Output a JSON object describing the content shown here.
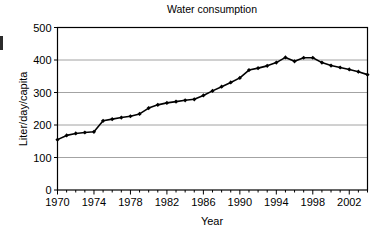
{
  "chart_data": {
    "type": "line",
    "title": "Water consumption",
    "xlabel": "Year",
    "ylabel": "Liter/day/capita",
    "xlim": [
      1970,
      2004
    ],
    "ylim": [
      0,
      500
    ],
    "yticks": [
      0,
      100,
      200,
      300,
      400,
      500
    ],
    "xticks": [
      1970,
      1974,
      1978,
      1982,
      1986,
      1990,
      1994,
      1998,
      2002
    ],
    "xtick_labels": [
      "1970",
      "1974",
      "1978",
      "1982",
      "1986",
      "1990",
      "1994",
      "1998",
      "2002"
    ],
    "ytick_labels": [
      "0",
      "100",
      "200",
      "300",
      "400",
      "500"
    ],
    "x_minor_tick_interval": 1,
    "grid": "horizontal",
    "legend": null,
    "marker": "diamond",
    "line_color": "#000000",
    "grid_color": "#8c8c8c",
    "x": [
      1970,
      1971,
      1972,
      1973,
      1974,
      1975,
      1976,
      1977,
      1978,
      1979,
      1980,
      1981,
      1982,
      1983,
      1984,
      1985,
      1986,
      1987,
      1988,
      1989,
      1990,
      1991,
      1992,
      1993,
      1994,
      1995,
      1996,
      1997,
      1998,
      1999,
      2000,
      2001,
      2002,
      2003,
      2004
    ],
    "values": [
      155,
      168,
      174,
      177,
      179,
      213,
      218,
      223,
      227,
      234,
      252,
      262,
      268,
      272,
      276,
      279,
      291,
      305,
      318,
      331,
      345,
      369,
      375,
      382,
      392,
      408,
      396,
      407,
      407,
      392,
      383,
      377,
      371,
      364,
      355
    ],
    "series": [
      {
        "name": "Water consumption",
        "values": [
          155,
          168,
          174,
          177,
          179,
          213,
          218,
          223,
          227,
          234,
          252,
          262,
          268,
          272,
          276,
          279,
          291,
          305,
          318,
          331,
          345,
          369,
          375,
          382,
          392,
          408,
          396,
          407,
          407,
          392,
          383,
          377,
          371,
          364,
          355
        ]
      }
    ]
  }
}
